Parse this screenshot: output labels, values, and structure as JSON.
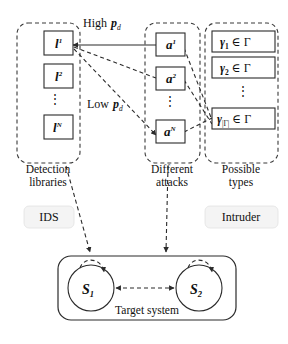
{
  "diagram": {
    "groups": {
      "detection": {
        "caption_line1": "Detection",
        "caption_line2": "libraries",
        "items": [
          "l",
          "l",
          "l"
        ],
        "item_labels": [
          "l¹",
          "l²",
          "lᴺ"
        ],
        "bases": [
          "l",
          "l",
          "l"
        ],
        "supers": [
          "1",
          "2",
          "N"
        ],
        "ellipsis": "⋮"
      },
      "attacks": {
        "caption_line1": "Different",
        "caption_line2": "attacks",
        "item_labels": [
          "a¹",
          "a²",
          "aᴺ"
        ],
        "bases": [
          "a",
          "a",
          "a"
        ],
        "supers": [
          "1",
          "2",
          "N"
        ],
        "ellipsis": "⋮"
      },
      "types": {
        "caption_line1": "Possible",
        "caption_line2": "types",
        "item_labels": [
          "γ₁ ∈ Γ",
          "γ₂ ∈ Γ",
          "γ|Γ| ∈ Γ"
        ],
        "bases": [
          "γ",
          "γ",
          "γ"
        ],
        "subs": [
          "1",
          "2",
          "|Γ|"
        ],
        "membership": "∈ Γ",
        "ellipsis": "⋮"
      }
    },
    "edge_labels": {
      "high": "High",
      "high_sym_base": "p",
      "high_sym_sub": "d",
      "low": "Low",
      "low_sym_base": "p",
      "low_sym_sub": "d"
    },
    "actors": {
      "ids": "IDS",
      "intruder": "Intruder"
    },
    "target_system": {
      "caption": "Target system",
      "states": [
        "S",
        "S"
      ],
      "state_labels": [
        "S₁",
        "S₂"
      ],
      "state_bases": [
        "S",
        "S"
      ],
      "state_subs": [
        "1",
        "2"
      ]
    },
    "colors": {
      "stroke": "#2b2b2b",
      "dashed": "#3a3a3a",
      "background": "#ffffff",
      "tag_fill": "#f4f4f4"
    }
  }
}
